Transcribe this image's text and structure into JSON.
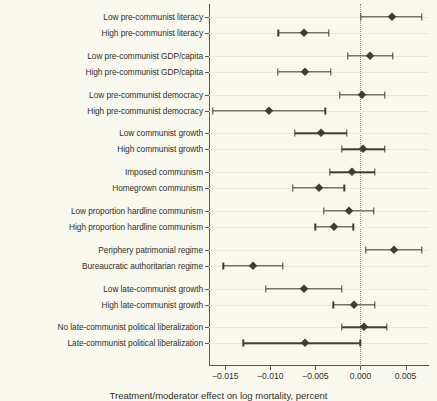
{
  "figure": {
    "background_color": "#f9f9ef",
    "marker_color": "#3d3d33",
    "grid_color": "#e9e9d8",
    "axis_color": "#57574a",
    "caption": "Treatment/moderator effect on log mortality, percent"
  },
  "chart_data": {
    "type": "scatter",
    "title": "",
    "xlabel": "",
    "ylabel": "",
    "xlim": [
      -0.0168,
      0.0076
    ],
    "xticks": [
      -0.015,
      -0.01,
      -0.005,
      0.0,
      0.005
    ],
    "xticklabels": [
      "−0.015",
      "−0.010",
      "−0.005",
      "0.000",
      "0.005"
    ],
    "grid": true,
    "legend": "none",
    "reference_line_x": 0.0,
    "reference_line_style": "dotted",
    "orientation": "horizontal-error-bars",
    "categories": [
      "Low pre-communist literacy",
      "High pre-communist literacy",
      "Low pre-communist GDP/capita",
      "High pre-communist GDP/capita",
      "Low pre-communist democracy",
      "High pre-communist democracy",
      "Low communist growth",
      "High communist growth",
      "Imposed communism",
      "Homegrown communism",
      "Low proportion hardline communism",
      "High proportion hardline communism",
      "Periphery patrimonial regime",
      "Bureaucratic authoritarian regime",
      "Low late-communist growth",
      "High late-communist growth",
      "No late-communist political liberalization",
      "Late-communist political liberalization"
    ],
    "groups": [
      [
        0,
        1
      ],
      [
        2,
        3
      ],
      [
        4,
        5
      ],
      [
        6,
        7
      ],
      [
        8,
        9
      ],
      [
        10,
        11
      ],
      [
        12,
        13
      ],
      [
        14,
        15
      ],
      [
        16,
        17
      ]
    ],
    "estimates": [
      0.0035,
      -0.0063,
      0.0011,
      -0.0062,
      0.0002,
      -0.0101,
      -0.0044,
      0.0003,
      -0.0009,
      -0.0046,
      -0.0013,
      -0.0029,
      0.0037,
      -0.0119,
      -0.0063,
      -0.0007,
      0.0004,
      -0.0062
    ],
    "ci_low": [
      5e-05,
      -0.0091,
      -0.0014,
      -0.0092,
      -0.0023,
      -0.0164,
      -0.0073,
      -0.0021,
      -0.0034,
      -0.0075,
      -0.0041,
      -0.005,
      0.0006,
      -0.0152,
      -0.0105,
      -0.003,
      -0.0021,
      -0.013
    ],
    "ci_high": [
      0.0068,
      -0.0035,
      0.0036,
      -0.0033,
      0.0027,
      -0.0039,
      -0.0015,
      0.0027,
      0.0016,
      -0.0018,
      0.0015,
      -0.0008,
      0.0068,
      -0.0086,
      -0.0021,
      0.0016,
      0.0029,
      0.0
    ]
  }
}
